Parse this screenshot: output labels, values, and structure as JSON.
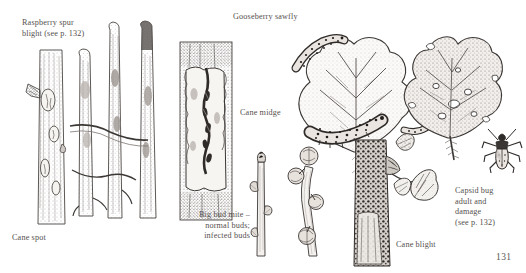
{
  "plate": {
    "title": "Raspberry and currant pests and diseases illustration plate",
    "background_color": "#ffffff",
    "ink_color": "#3b3735",
    "text_color": "#55504e",
    "page_number": "131"
  },
  "labels": {
    "raspberry_spur_blight": "Raspberry spur\nblight (see p. 132)",
    "gooseberry_sawfly": "Gooseberry sawfly",
    "cane_midge": "Cane midge",
    "big_bud_mite": "Big bud mite –\nnormal buds;\ninfected buds",
    "capsid_bug": "Capsid bug\nadult and\ndamage\n(see p. 132)",
    "cane_blight": "Cane blight",
    "cane_spot": "Cane spot"
  },
  "figures": [
    {
      "name": "cane-spot-cane",
      "caption": "Cane spot"
    },
    {
      "name": "raspberry-spur-blight-canes",
      "caption": "Raspberry spur blight (see p. 132)"
    },
    {
      "name": "cane-midge-cane",
      "caption": "Cane midge"
    },
    {
      "name": "normal-buds-stem",
      "caption": "Big bud mite – normal buds"
    },
    {
      "name": "infected-buds-stem",
      "caption": "Big bud mite – infected buds"
    },
    {
      "name": "gooseberry-sawfly-leaf",
      "caption": "Gooseberry sawfly"
    },
    {
      "name": "cane-blight-cane",
      "caption": "Cane blight"
    },
    {
      "name": "capsid-bug-damaged-leaf",
      "caption": "Capsid bug damage"
    },
    {
      "name": "capsid-bug-adult",
      "caption": "Capsid bug adult"
    }
  ]
}
